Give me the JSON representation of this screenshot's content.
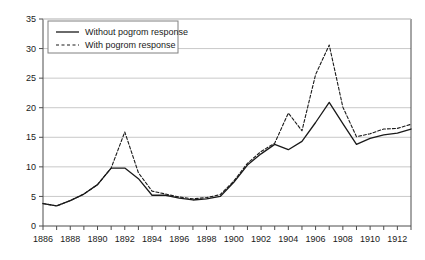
{
  "chart_data": {
    "type": "line",
    "title": "",
    "xlabel": "",
    "ylabel": "",
    "xlim": [
      1886,
      1913
    ],
    "ylim": [
      0,
      35
    ],
    "ytick_step": 5,
    "yticks": [
      0,
      5,
      10,
      15,
      20,
      25,
      30,
      35
    ],
    "xticks": [
      1886,
      1887,
      1888,
      1889,
      1890,
      1891,
      1892,
      1893,
      1894,
      1895,
      1896,
      1897,
      1898,
      1899,
      1900,
      1901,
      1902,
      1903,
      1904,
      1905,
      1906,
      1907,
      1908,
      1909,
      1910,
      1911,
      1912,
      1913
    ],
    "xtick_labels": [
      "1886",
      "",
      "1888",
      "",
      "1890",
      "",
      "1892",
      "",
      "1894",
      "",
      "1896",
      "",
      "1898",
      "",
      "1900",
      "",
      "1902",
      "",
      "1904",
      "",
      "1906",
      "",
      "1908",
      "",
      "1910",
      "",
      "1912",
      ""
    ],
    "xtick_labels_shown": [
      "1886",
      "1888",
      "1890",
      "1892",
      "1894",
      "1896",
      "1898",
      "1900",
      "1902",
      "1904",
      "1906",
      "1908",
      "1910",
      "1912"
    ],
    "x": [
      1886,
      1887,
      1888,
      1889,
      1890,
      1891,
      1892,
      1893,
      1894,
      1895,
      1896,
      1897,
      1898,
      1899,
      1900,
      1901,
      1902,
      1903,
      1904,
      1905,
      1906,
      1907,
      1908,
      1909,
      1910,
      1911,
      1912,
      1913
    ],
    "grid": true,
    "grid_axis": "y",
    "legend_position": "top-left",
    "series": [
      {
        "name": "Without pogrom response",
        "style": "solid",
        "color": "#1a1a1a",
        "values": [
          3.8,
          3.4,
          4.3,
          5.4,
          7.0,
          9.8,
          9.8,
          8.0,
          5.2,
          5.2,
          4.7,
          4.4,
          4.6,
          5.0,
          7.4,
          10.3,
          12.2,
          13.8,
          12.9,
          14.3,
          17.5,
          20.9,
          17.3,
          13.8,
          14.8,
          15.4,
          15.7,
          16.4
        ]
      },
      {
        "name": "With pogrom response",
        "style": "dashed",
        "color": "#1a1a1a",
        "values": [
          3.8,
          3.4,
          4.3,
          5.4,
          7.0,
          9.8,
          15.9,
          9.0,
          5.9,
          5.4,
          4.9,
          4.6,
          4.8,
          5.3,
          7.6,
          10.6,
          12.6,
          14.0,
          19.1,
          16.1,
          25.6,
          30.6,
          20.1,
          15.1,
          15.6,
          16.4,
          16.5,
          17.2
        ]
      }
    ]
  },
  "legend": {
    "entries": [
      {
        "label": "Without pogrom response",
        "style": "solid"
      },
      {
        "label": "With pogrom response",
        "style": "dashed"
      }
    ]
  },
  "colors": {
    "axis": "#4d4d4d",
    "grid": "#c9c9c9",
    "line": "#1a1a1a",
    "text": "#1a1a1a",
    "legend_border": "#808080",
    "background": "#ffffff"
  }
}
